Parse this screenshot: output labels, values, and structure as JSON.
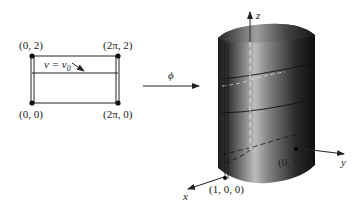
{
  "domain_rectangle": {
    "corner_labels": {
      "top_left": "(0, 2)",
      "top_right": "(2π, 2)",
      "bottom_left": "(0, 0)",
      "bottom_right": "(2π, 0)"
    },
    "line_label": "v = v",
    "line_label_subscript": "0"
  },
  "mapping": {
    "label": "ϕ"
  },
  "cylinder": {
    "axis_labels": {
      "x": "x",
      "y": "y",
      "z": "z"
    },
    "point_labels": {
      "x_point": "(1, 0, 0)",
      "y_point": "(0, 1, 0)"
    },
    "colors": {
      "dark": "#1a1a1a",
      "light": "#c8c8c8",
      "mid": "#6e6e6e"
    }
  }
}
